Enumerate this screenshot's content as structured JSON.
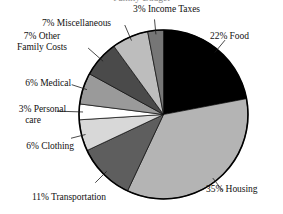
{
  "chart": {
    "title": "Family Budget",
    "title_clipped": true
  },
  "chart_data": {
    "type": "pie",
    "title": "Family Budget",
    "xlabel": "",
    "ylabel": "",
    "legend_position": "none",
    "grid": false,
    "categories": [
      "Food",
      "Housing",
      "Transportation",
      "Clothing",
      "Personal care",
      "Medical",
      "Other Family Costs",
      "Miscellaneous",
      "Income Taxes"
    ],
    "values": [
      22,
      35,
      11,
      6,
      3,
      6,
      7,
      7,
      3
    ],
    "unit": "%",
    "colors": [
      "#000000",
      "#b4b4b4",
      "#5e5e5e",
      "#d8d8d8",
      "#ffffff",
      "#9a9a9a",
      "#4a4a4a",
      "#bdbdbd",
      "#767676"
    ],
    "slices": [
      {
        "label": "22% Food",
        "name": "Food",
        "value": 22,
        "color": "#000000"
      },
      {
        "label": "35% Housing",
        "name": "Housing",
        "value": 35,
        "color": "#b4b4b4"
      },
      {
        "label": "11% Transportation",
        "name": "Transportation",
        "value": 11,
        "color": "#5e5e5e"
      },
      {
        "label": "6% Clothing",
        "name": "Clothing",
        "value": 6,
        "color": "#d8d8d8"
      },
      {
        "label": "3% Personal care",
        "name": "Personal care",
        "value": 3,
        "color": "#ffffff"
      },
      {
        "label": "6% Medical",
        "name": "Medical",
        "value": 6,
        "color": "#9a9a9a"
      },
      {
        "label": "7% Other Family Costs",
        "name": "Other Family Costs",
        "value": 7,
        "color": "#4a4a4a"
      },
      {
        "label": "7% Miscellaneous",
        "name": "Miscellaneous",
        "value": 7,
        "color": "#bdbdbd"
      },
      {
        "label": "3% Income Taxes",
        "name": "Income Taxes",
        "value": 3,
        "color": "#767676"
      }
    ]
  },
  "labels": {
    "income_taxes": "3% Income Taxes",
    "food": "22% Food",
    "housing": "35% Housing",
    "transportation": "11% Transportation",
    "clothing": "6% Clothing",
    "personal_care_line1": "3% Personal",
    "personal_care_line2": "care",
    "medical": "6% Medical",
    "other_family_line1": "7% Other",
    "other_family_line2": "Family Costs",
    "miscellaneous": "7% Miscellaneous"
  }
}
